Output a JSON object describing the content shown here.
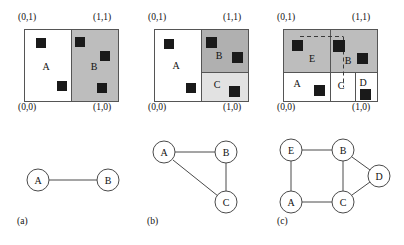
{
  "figure": {
    "caption_labels": [
      "(a)",
      "(b)",
      "(c)"
    ],
    "corner_labels": {
      "top_left": "(0,1)",
      "top_right": "(1,1)",
      "bottom_left": "(0,0)",
      "bottom_right": "(1,0)"
    },
    "colors": {
      "region_white": "#ffffff",
      "region_gray": "#bdbdbd",
      "region_gray_dark": "#b0b0b0",
      "region_gray_light": "#e2e2e2",
      "point_fill": "#1a1a1a",
      "border": "#555555",
      "node_stroke": "#4a4a4a",
      "edge": "#4a4a4a",
      "dashed": "#3a3a3a"
    }
  },
  "panels": [
    {
      "id": "a",
      "caption": "(a)",
      "regions": [
        {
          "name": "A",
          "label": "A",
          "fill": "#ffffff"
        },
        {
          "name": "B",
          "label": "B",
          "fill": "#bdbdbd"
        }
      ],
      "points": [
        {
          "region": "A",
          "x": 0.17,
          "y": 0.78
        },
        {
          "region": "A",
          "x": 0.4,
          "y": 0.22
        },
        {
          "region": "B",
          "x": 0.57,
          "y": 0.8
        },
        {
          "region": "B",
          "x": 0.83,
          "y": 0.62
        },
        {
          "region": "B",
          "x": 0.8,
          "y": 0.18
        }
      ],
      "graph": {
        "nodes": [
          {
            "id": "A",
            "label": "A"
          },
          {
            "id": "B",
            "label": "B"
          }
        ],
        "edges": [
          [
            "A",
            "B"
          ]
        ]
      }
    },
    {
      "id": "b",
      "caption": "(b)",
      "regions": [
        {
          "name": "A",
          "label": "A",
          "fill": "#ffffff"
        },
        {
          "name": "B",
          "label": "B",
          "fill": "#b0b0b0"
        },
        {
          "name": "C",
          "label": "C",
          "fill": "#e2e2e2"
        }
      ],
      "points": [
        {
          "region": "A",
          "x": 0.14,
          "y": 0.8
        },
        {
          "region": "A",
          "x": 0.39,
          "y": 0.2
        },
        {
          "region": "B",
          "x": 0.58,
          "y": 0.8
        },
        {
          "region": "B",
          "x": 0.87,
          "y": 0.62
        },
        {
          "region": "C",
          "x": 0.84,
          "y": 0.14
        }
      ],
      "graph": {
        "nodes": [
          {
            "id": "A",
            "label": "A"
          },
          {
            "id": "B",
            "label": "B"
          },
          {
            "id": "C",
            "label": "C"
          }
        ],
        "edges": [
          [
            "A",
            "B"
          ],
          [
            "B",
            "C"
          ],
          [
            "A",
            "C"
          ]
        ]
      }
    },
    {
      "id": "c",
      "caption": "(c)",
      "regions": [
        {
          "name": "E",
          "label": "E",
          "fill": "#bdbdbd"
        },
        {
          "name": "B",
          "label": "B",
          "fill": "#bdbdbd"
        },
        {
          "name": "A",
          "label": "A",
          "fill": "#ffffff"
        },
        {
          "name": "C",
          "label": "C",
          "fill": "#ffffff"
        },
        {
          "name": "D",
          "label": "D",
          "fill": "#ffffff"
        }
      ],
      "points": [
        {
          "region": "E",
          "x": 0.13,
          "y": 0.82
        },
        {
          "region": "B",
          "x": 0.57,
          "y": 0.82
        },
        {
          "region": "B",
          "x": 0.82,
          "y": 0.62
        },
        {
          "region": "A",
          "x": 0.36,
          "y": 0.15
        },
        {
          "region": "D",
          "x": 0.83,
          "y": 0.1
        }
      ],
      "dashed_cuts": true,
      "graph": {
        "nodes": [
          {
            "id": "E",
            "label": "E"
          },
          {
            "id": "B",
            "label": "B"
          },
          {
            "id": "D",
            "label": "D"
          },
          {
            "id": "A",
            "label": "A"
          },
          {
            "id": "C",
            "label": "C"
          }
        ],
        "edges": [
          [
            "E",
            "B"
          ],
          [
            "E",
            "A"
          ],
          [
            "A",
            "C"
          ],
          [
            "B",
            "C"
          ],
          [
            "B",
            "D"
          ],
          [
            "C",
            "D"
          ]
        ]
      }
    }
  ]
}
